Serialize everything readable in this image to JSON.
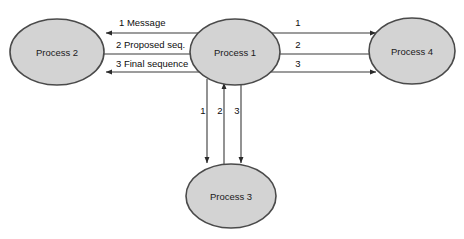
{
  "diagram": {
    "background_color": "#ffffff",
    "node_fill_color": "#d3d3d3",
    "node_border_color": "#4a4a4a",
    "edge_color": "#3a3a3a",
    "nodes": [
      {
        "id": "p2",
        "label": "Process 2",
        "cx": 57,
        "cy": 52,
        "rx": 47,
        "ry": 33
      },
      {
        "id": "p1",
        "label": "Process 1",
        "cx": 235,
        "cy": 52,
        "rx": 45,
        "ry": 33
      },
      {
        "id": "p4",
        "label": "Process 4",
        "cx": 412,
        "cy": 51,
        "rx": 43,
        "ry": 33
      },
      {
        "id": "p3",
        "label": "Process 3",
        "cx": 231,
        "cy": 196,
        "rx": 45,
        "ry": 32
      }
    ],
    "left_edges": [
      {
        "seq": "1",
        "label": "1 Message",
        "direction": "p1-to-p2"
      },
      {
        "seq": "2",
        "label": "2 Proposed seq.",
        "direction": "p2-to-p1"
      },
      {
        "seq": "3",
        "label": "3 Final sequence",
        "direction": "p1-to-p2"
      }
    ],
    "right_edges": [
      {
        "seq": "1",
        "label": "1",
        "direction": "p1-to-p4"
      },
      {
        "seq": "2",
        "label": "2",
        "direction": "p4-to-p1"
      },
      {
        "seq": "3",
        "label": "3",
        "direction": "p1-to-p4"
      }
    ],
    "bottom_edges": [
      {
        "seq": "1",
        "label": "1",
        "direction": "p1-to-p3"
      },
      {
        "seq": "2",
        "label": "2",
        "direction": "p3-to-p1"
      },
      {
        "seq": "3",
        "label": "3",
        "direction": "p1-to-p3"
      }
    ]
  }
}
